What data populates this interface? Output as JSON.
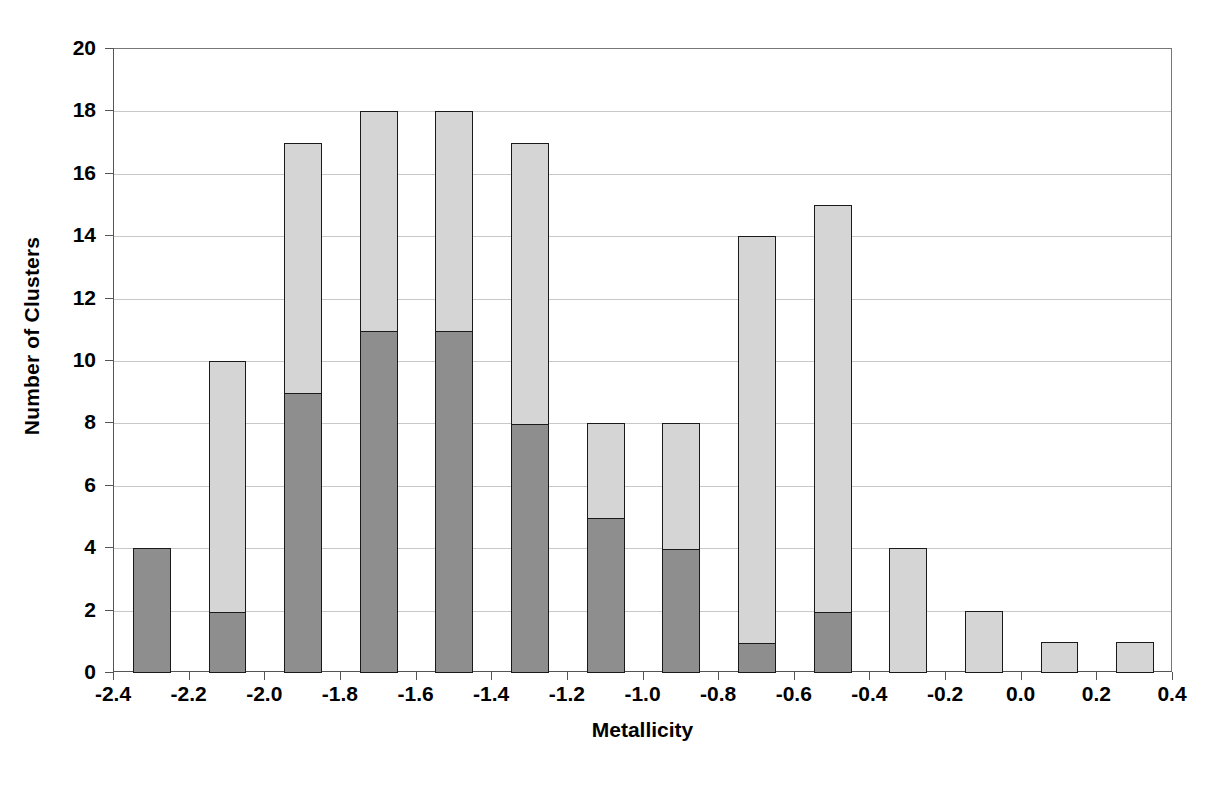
{
  "chart_data": {
    "type": "bar",
    "subtype": "stacked-histogram",
    "title": "",
    "xlabel": "Metallicity",
    "ylabel": "Number of Clusters",
    "xlim": [
      -2.4,
      0.4
    ],
    "ylim": [
      0,
      20
    ],
    "grid": true,
    "legend": "none",
    "xtick_labels": [
      "-2.4",
      "-2.2",
      "-2.0",
      "-1.8",
      "-1.6",
      "-1.4",
      "-1.2",
      "-1.0",
      "-0.8",
      "-0.6",
      "-0.4",
      "-0.2",
      "0.0",
      "0.2",
      "0.4"
    ],
    "xticks": [
      -2.4,
      -2.2,
      -2.0,
      -1.8,
      -1.6,
      -1.4,
      -1.2,
      -1.0,
      -0.8,
      -0.6,
      -0.4,
      -0.2,
      0.0,
      0.2,
      0.4
    ],
    "ytick_labels": [
      "0",
      "2",
      "4",
      "6",
      "8",
      "10",
      "12",
      "14",
      "16",
      "18",
      "20"
    ],
    "yticks": [
      0,
      2,
      4,
      6,
      8,
      10,
      12,
      14,
      16,
      18,
      20
    ],
    "bin_width": 0.2,
    "bar_width_fraction": 0.5,
    "bin_centers": [
      -2.3,
      -2.1,
      -1.9,
      -1.7,
      -1.5,
      -1.3,
      -1.1,
      -0.9,
      -0.7,
      -0.5,
      -0.3,
      -0.1,
      0.1,
      0.3
    ],
    "series": [
      {
        "name": "dark",
        "color": "#8e8e8e",
        "values": [
          4,
          2,
          9,
          11,
          11,
          8,
          5,
          4,
          1,
          2,
          0,
          0,
          0,
          0
        ]
      },
      {
        "name": "light",
        "color": "#d5d5d5",
        "values": [
          0,
          8,
          8,
          7,
          7,
          9,
          3,
          4,
          13,
          13,
          4,
          2,
          1,
          1
        ]
      }
    ],
    "totals": [
      4,
      10,
      17,
      18,
      18,
      17,
      8,
      8,
      14,
      15,
      4,
      2,
      1,
      1
    ]
  },
  "axes": {
    "y_title": "Number of Clusters",
    "x_title": "Metallicity"
  }
}
